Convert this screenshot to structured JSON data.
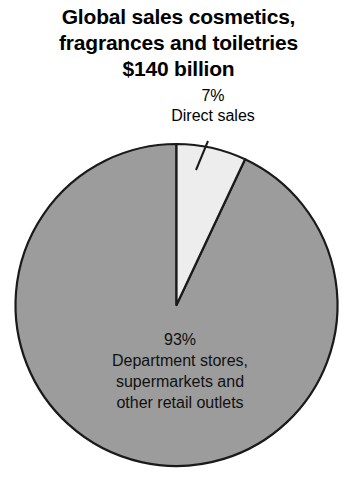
{
  "chart_data": {
    "type": "pie",
    "title": "Global sales cosmetics, fragrances and toiletries $140 billion",
    "title_lines": [
      "Global sales cosmetics,",
      "fragrances and toiletries",
      "$140 billion"
    ],
    "categories": [
      "Direct sales",
      "Department stores, supermarkets and other retail outlets"
    ],
    "values": [
      7,
      93
    ],
    "value_unit": "%",
    "total_label": "$140 billion",
    "xlabel": "",
    "ylabel": "",
    "legend": "none",
    "grid": false,
    "slices": [
      {
        "name": "direct-sales",
        "percent_label": "7%",
        "value": 7,
        "label_lines": [
          "7%",
          "Direct sales"
        ],
        "color": "#ededed",
        "label_placement": "outside-callout",
        "start_angle_deg": 0,
        "end_angle_deg": 25.2
      },
      {
        "name": "retail-outlets",
        "percent_label": "93%",
        "value": 93,
        "label_lines": [
          "93%",
          "Department stores,",
          "supermarkets and",
          "other retail outlets"
        ],
        "color": "#9c9c9c",
        "label_placement": "inside",
        "start_angle_deg": 25.2,
        "end_angle_deg": 360
      }
    ],
    "outline_color": "#1a1a1a",
    "background_color": "#ffffff",
    "callout_leader_line": true
  }
}
